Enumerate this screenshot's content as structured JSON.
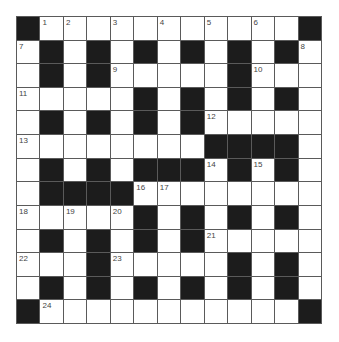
{
  "puzzle": {
    "rows": 13,
    "cols": 13,
    "colors": {
      "block": "#1c1c1c",
      "cell": "#ffffff",
      "gridline": "#5a5a5a",
      "number": "#444444"
    },
    "legend": "B = black square, W = white square, number = numbered white square",
    "grid": [
      [
        "B",
        "1",
        "2",
        "W",
        "3",
        "W",
        "4",
        "W",
        "5",
        "W",
        "6",
        "W",
        "B"
      ],
      [
        "7",
        "B",
        "W",
        "B",
        "W",
        "B",
        "W",
        "B",
        "W",
        "B",
        "W",
        "B",
        "8"
      ],
      [
        "W",
        "B",
        "W",
        "B",
        "9",
        "W",
        "W",
        "W",
        "W",
        "B",
        "10",
        "W",
        "W"
      ],
      [
        "11",
        "W",
        "W",
        "W",
        "W",
        "B",
        "W",
        "B",
        "W",
        "B",
        "W",
        "B",
        "W"
      ],
      [
        "W",
        "B",
        "W",
        "B",
        "W",
        "B",
        "W",
        "B",
        "12",
        "W",
        "W",
        "W",
        "W"
      ],
      [
        "13",
        "W",
        "W",
        "W",
        "W",
        "W",
        "W",
        "W",
        "B",
        "B",
        "B",
        "B",
        "W"
      ],
      [
        "W",
        "B",
        "W",
        "B",
        "W",
        "B",
        "B",
        "B",
        "14",
        "B",
        "15",
        "B",
        "W"
      ],
      [
        "W",
        "B",
        "B",
        "B",
        "B",
        "16",
        "17",
        "W",
        "W",
        "W",
        "W",
        "W",
        "W"
      ],
      [
        "18",
        "W",
        "19",
        "W",
        "20",
        "B",
        "W",
        "B",
        "W",
        "B",
        "W",
        "B",
        "W"
      ],
      [
        "W",
        "B",
        "W",
        "B",
        "W",
        "B",
        "W",
        "B",
        "21",
        "W",
        "W",
        "W",
        "W"
      ],
      [
        "22",
        "W",
        "W",
        "B",
        "23",
        "W",
        "W",
        "W",
        "W",
        "B",
        "W",
        "B",
        "W"
      ],
      [
        "W",
        "B",
        "W",
        "B",
        "W",
        "B",
        "W",
        "B",
        "W",
        "B",
        "W",
        "B",
        "W"
      ],
      [
        "B",
        "24",
        "W",
        "W",
        "W",
        "W",
        "W",
        "W",
        "W",
        "W",
        "W",
        "W",
        "B"
      ]
    ],
    "clue_numbers": [
      1,
      2,
      3,
      4,
      5,
      6,
      7,
      8,
      9,
      10,
      11,
      12,
      13,
      14,
      15,
      16,
      17,
      18,
      19,
      20,
      21,
      22,
      23,
      24
    ]
  }
}
